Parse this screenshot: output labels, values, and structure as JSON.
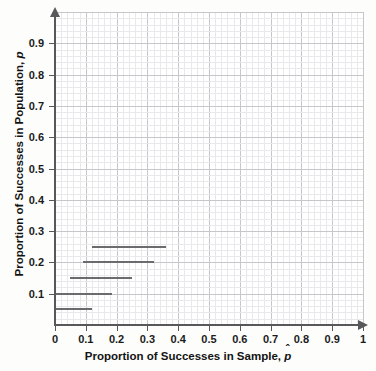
{
  "chart_data": {
    "type": "line",
    "title": "",
    "xlabel": "Proportion of Successes in Sample, p̂",
    "ylabel": "Proportion of Successes in Population, p",
    "xlim": [
      0,
      1
    ],
    "ylim": [
      0,
      1
    ],
    "grid": true,
    "major_tick_step": 0.1,
    "minor_tick_step": 0.02,
    "legend": "none",
    "x_tick_labels": [
      "0",
      "0.1",
      "0.2",
      "0.3",
      "0.4",
      "0.5",
      "0.6",
      "0.7",
      "0.8",
      "0.9",
      "1"
    ],
    "x_tick_values": [
      0,
      0.1,
      0.2,
      0.3,
      0.4,
      0.5,
      0.6,
      0.7,
      0.8,
      0.9,
      1
    ],
    "y_tick_labels": [
      "0.1",
      "0.2",
      "0.3",
      "0.4",
      "0.5",
      "0.6",
      "0.7",
      "0.8",
      "0.9"
    ],
    "y_tick_values": [
      0.1,
      0.2,
      0.3,
      0.4,
      0.5,
      0.6,
      0.7,
      0.8,
      0.9
    ],
    "series": [
      {
        "name": "confidence-interval-p-0.25",
        "y": 0.25,
        "x_start": 0.12,
        "x_end": 0.36
      },
      {
        "name": "confidence-interval-p-0.20",
        "y": 0.2,
        "x_start": 0.09,
        "x_end": 0.32
      },
      {
        "name": "confidence-interval-p-0.15",
        "y": 0.15,
        "x_start": 0.05,
        "x_end": 0.25
      },
      {
        "name": "confidence-interval-p-0.10",
        "y": 0.1,
        "x_start": 0.0,
        "x_end": 0.185
      },
      {
        "name": "confidence-interval-p-0.05",
        "y": 0.05,
        "x_start": 0.0,
        "x_end": 0.12
      }
    ],
    "colors": {
      "segment": "#6b6b6e",
      "axis": "#58585a",
      "major_grid": "#c6c6cb",
      "minor_grid": "#e9e9ec",
      "background": "#ffffff",
      "text": "#131313"
    }
  },
  "axis_titles": {
    "x_prefix": "Proportion of Successes in Sample,",
    "x_variable": "p",
    "x_variable_hat": "ˆ",
    "y_prefix": "Proportion of Successes in Population,",
    "y_variable": "p"
  }
}
